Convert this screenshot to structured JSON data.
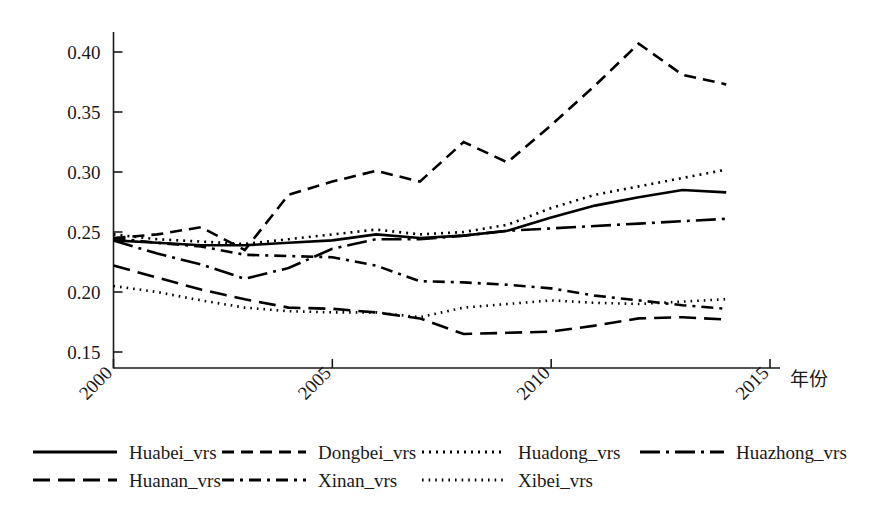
{
  "chart_data": {
    "type": "line",
    "title": "",
    "xlabel": "年份",
    "ylabel": "",
    "x": [
      2000,
      2001,
      2002,
      2003,
      2004,
      2005,
      2006,
      2007,
      2008,
      2009,
      2010,
      2011,
      2012,
      2013,
      2014
    ],
    "xlim": [
      2000,
      2015
    ],
    "ylim": [
      0.15,
      0.41
    ],
    "xticks": [
      "2000",
      "2005",
      "2010",
      "2015"
    ],
    "xtick_values": [
      2000,
      2005,
      2010,
      2015
    ],
    "yticks": [
      "0.15",
      "0.20",
      "0.25",
      "0.30",
      "0.35",
      "0.40"
    ],
    "ytick_values": [
      0.15,
      0.2,
      0.25,
      0.3,
      0.35,
      0.4
    ],
    "grid": false,
    "legend_position": "below-plot",
    "line_color": "#000000",
    "series": [
      {
        "name": "Huabei_vrs",
        "style": "solid",
        "dash": "none",
        "values": [
          0.243,
          0.241,
          0.239,
          0.239,
          0.241,
          0.243,
          0.248,
          0.245,
          0.247,
          0.251,
          0.262,
          0.272,
          0.279,
          0.285,
          0.283
        ]
      },
      {
        "name": "Dongbei_vrs",
        "style": "dashed",
        "dash": "12,7",
        "values": [
          0.245,
          0.248,
          0.254,
          0.235,
          0.281,
          0.292,
          0.301,
          0.292,
          0.325,
          0.308,
          0.339,
          0.372,
          0.407,
          0.381,
          0.373
        ]
      },
      {
        "name": "Huadong_vrs",
        "style": "dotted",
        "dash": "2,5",
        "values": [
          0.248,
          0.244,
          0.242,
          0.24,
          0.244,
          0.248,
          0.252,
          0.248,
          0.25,
          0.256,
          0.27,
          0.281,
          0.288,
          0.295,
          0.302
        ]
      },
      {
        "name": "Huazhong_vrs",
        "style": "long-dash-dot",
        "dash": "20,6,3,6",
        "values": [
          0.243,
          0.232,
          0.223,
          0.211,
          0.22,
          0.236,
          0.244,
          0.244,
          0.247,
          0.251,
          0.253,
          0.255,
          0.257,
          0.259,
          0.261
        ]
      },
      {
        "name": "Huanan_vrs",
        "style": "long-dash",
        "dash": "17,8",
        "values": [
          0.222,
          0.212,
          0.202,
          0.194,
          0.187,
          0.186,
          0.183,
          0.178,
          0.165,
          0.166,
          0.167,
          0.172,
          0.178,
          0.179,
          0.177
        ]
      },
      {
        "name": "Xinan_vrs",
        "style": "dash-dot",
        "dash": "12,6,3,6",
        "values": [
          0.245,
          0.241,
          0.238,
          0.231,
          0.23,
          0.229,
          0.222,
          0.209,
          0.208,
          0.206,
          0.203,
          0.197,
          0.193,
          0.189,
          0.186
        ]
      },
      {
        "name": "Xibei_vrs",
        "style": "fine-dotted",
        "dash": "1.6,5",
        "values": [
          0.205,
          0.2,
          0.193,
          0.187,
          0.184,
          0.183,
          0.183,
          0.179,
          0.187,
          0.19,
          0.193,
          0.191,
          0.19,
          0.192,
          0.194
        ]
      }
    ]
  },
  "legend": {
    "rows": [
      [
        "Huabei_vrs",
        "Dongbei_vrs",
        "Huadong_vrs",
        "Huazhong_vrs"
      ],
      [
        "Huanan_vrs",
        "Xinan_vrs",
        "Xibei_vrs"
      ]
    ]
  }
}
